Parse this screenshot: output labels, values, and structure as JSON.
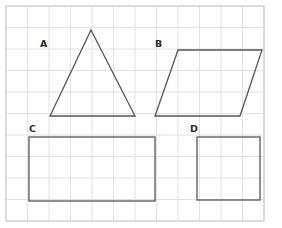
{
  "page": {
    "background_color": "#ffffff",
    "width": 282,
    "height": 228
  },
  "grid": {
    "name": "square-grid",
    "origin_x": 6,
    "origin_y": 6,
    "cell_size": 21.5,
    "columns": 12,
    "rows": 10,
    "line_color": "#e2e2e6",
    "border_color": "#d2d2d8",
    "line_width": 1
  },
  "shapes": [
    {
      "id": "A",
      "label": "A",
      "type": "triangle",
      "name": "triangle-shape-a",
      "points": "91,30 135,116 50,116",
      "stroke": "#555555",
      "stroke_width": 1.3,
      "fill": "none",
      "label_x": 40,
      "label_y": 47,
      "base_units": 4,
      "height_units": 4
    },
    {
      "id": "B",
      "label": "B",
      "type": "parallelogram",
      "name": "parallelogram-shape-b",
      "points": "178,50 262,50 240,116 155,116",
      "stroke": "#555555",
      "stroke_width": 1.3,
      "fill": "none",
      "label_x": 155,
      "label_y": 47,
      "base_units": 4,
      "height_units": 3
    },
    {
      "id": "C",
      "label": "C",
      "type": "rectangle",
      "name": "rectangle-shape-c",
      "x": 29,
      "y": 137,
      "width": 126,
      "height": 64,
      "stroke": "#555555",
      "stroke_width": 1.3,
      "fill": "none",
      "label_x": 29,
      "label_y": 132,
      "base_units": 6,
      "height_units": 3
    },
    {
      "id": "D",
      "label": "D",
      "type": "square",
      "name": "square-shape-d",
      "x": 197,
      "y": 137,
      "width": 63,
      "height": 63,
      "stroke": "#555555",
      "stroke_width": 1.3,
      "fill": "none",
      "label_x": 190,
      "label_y": 132,
      "base_units": 3,
      "height_units": 3
    }
  ]
}
